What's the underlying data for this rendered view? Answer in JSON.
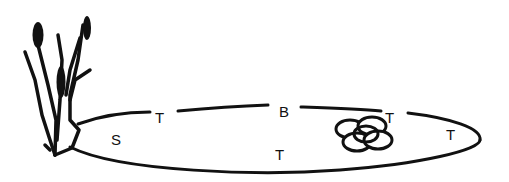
{
  "diagram": {
    "labels": [
      {
        "id": "s-left",
        "text": "S",
        "x": 111,
        "y": 132
      },
      {
        "id": "t-upper-left",
        "text": "T",
        "x": 155,
        "y": 110
      },
      {
        "id": "b-top",
        "text": "B",
        "x": 279,
        "y": 104
      },
      {
        "id": "t-bottom-middle",
        "text": "T",
        "x": 275,
        "y": 147
      },
      {
        "id": "t-upper-right",
        "text": "T",
        "x": 385,
        "y": 110
      },
      {
        "id": "t-right",
        "text": "T",
        "x": 446,
        "y": 127
      }
    ],
    "elements": {
      "plant": "cattail-plant",
      "outline": "oval-outline",
      "eggs": "egg-cluster",
      "egg_count": 5
    },
    "colors": {
      "stroke": "#111111",
      "background": "#ffffff"
    }
  }
}
